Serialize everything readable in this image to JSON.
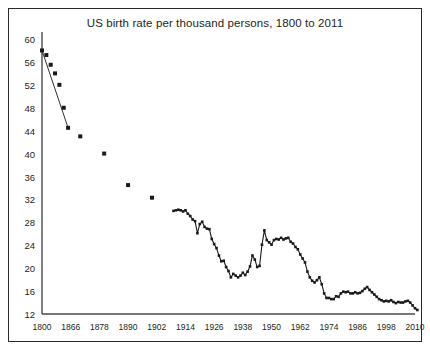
{
  "chart_data": {
    "type": "line",
    "title": "US birth rate per thousand persons, 1800 to 2011",
    "xlabel": "",
    "ylabel": "",
    "xlim": [
      1800,
      2011
    ],
    "ylim": [
      12,
      60
    ],
    "grid": false,
    "legend": null,
    "marker": "square",
    "marker_color": "#1a1a1a",
    "line_color": "#1a1a1a",
    "ytick_labels": [
      "12",
      "16",
      "20",
      "24",
      "28",
      "32",
      "36",
      "40",
      "44",
      "48",
      "52",
      "56",
      "60"
    ],
    "ytick_values": [
      12,
      16,
      20,
      24,
      28,
      32,
      36,
      40,
      44,
      48,
      52,
      56,
      60
    ],
    "xtick_labels": [
      "1800",
      "1866",
      "1878",
      "1890",
      "1902",
      "1914",
      "1926",
      "1938",
      "1950",
      "1962",
      "1974",
      "1986",
      "1998",
      "2010"
    ],
    "xtick_values": [
      1800,
      1866,
      1878,
      1890,
      1902,
      1914,
      1926,
      1938,
      1950,
      1962,
      1974,
      1986,
      1998,
      2010
    ],
    "x": [
      1800,
      1810,
      1820,
      1830,
      1840,
      1850,
      1860,
      1870,
      1880,
      1890,
      1900,
      1909,
      1910,
      1911,
      1912,
      1913,
      1914,
      1915,
      1916,
      1917,
      1918,
      1919,
      1920,
      1921,
      1922,
      1923,
      1924,
      1925,
      1926,
      1927,
      1928,
      1929,
      1930,
      1931,
      1932,
      1933,
      1934,
      1935,
      1936,
      1937,
      1938,
      1939,
      1940,
      1941,
      1942,
      1943,
      1944,
      1945,
      1946,
      1947,
      1948,
      1949,
      1950,
      1951,
      1952,
      1953,
      1954,
      1955,
      1956,
      1957,
      1958,
      1959,
      1960,
      1961,
      1962,
      1963,
      1964,
      1965,
      1966,
      1967,
      1968,
      1969,
      1970,
      1971,
      1972,
      1973,
      1974,
      1975,
      1976,
      1977,
      1978,
      1979,
      1980,
      1981,
      1982,
      1983,
      1984,
      1985,
      1986,
      1987,
      1988,
      1989,
      1990,
      1991,
      1992,
      1993,
      1994,
      1995,
      1996,
      1997,
      1998,
      1999,
      2000,
      2001,
      2002,
      2003,
      2004,
      2005,
      2006,
      2007,
      2008,
      2009,
      2010,
      2011
    ],
    "values": [
      58.0,
      57.2,
      55.5,
      54.0,
      52.0,
      48.0,
      44.5,
      43.0,
      40.0,
      34.5,
      32.3,
      30.0,
      30.1,
      30.2,
      30.1,
      29.9,
      30.1,
      29.5,
      29.1,
      28.5,
      28.2,
      26.1,
      27.7,
      28.1,
      27.2,
      26.9,
      26.8,
      25.1,
      24.2,
      23.5,
      22.2,
      21.2,
      21.3,
      20.2,
      19.5,
      18.4,
      19.0,
      18.7,
      18.4,
      18.7,
      19.2,
      18.8,
      19.4,
      20.3,
      22.2,
      21.5,
      20.2,
      20.4,
      24.1,
      26.6,
      24.9,
      24.5,
      24.1,
      24.9,
      25.1,
      25.0,
      25.3,
      25.0,
      25.2,
      25.3,
      24.6,
      24.3,
      23.7,
      23.3,
      22.4,
      21.7,
      21.0,
      19.4,
      18.4,
      17.8,
      17.5,
      17.9,
      18.4,
      17.2,
      15.6,
      14.8,
      14.8,
      14.6,
      14.6,
      15.1,
      15.0,
      15.6,
      15.9,
      15.8,
      15.9,
      15.6,
      15.6,
      15.8,
      15.6,
      15.7,
      16.0,
      16.4,
      16.7,
      16.2,
      15.8,
      15.4,
      15.0,
      14.6,
      14.4,
      14.2,
      14.3,
      14.2,
      14.4,
      14.1,
      13.9,
      14.1,
      14.0,
      14.0,
      14.2,
      14.3,
      14.0,
      13.5,
      13.0,
      12.7
    ]
  },
  "figure": {
    "background_color": "#ffffff",
    "border_color": "#2b2b2b",
    "axis_color": "#4a4a4a"
  }
}
